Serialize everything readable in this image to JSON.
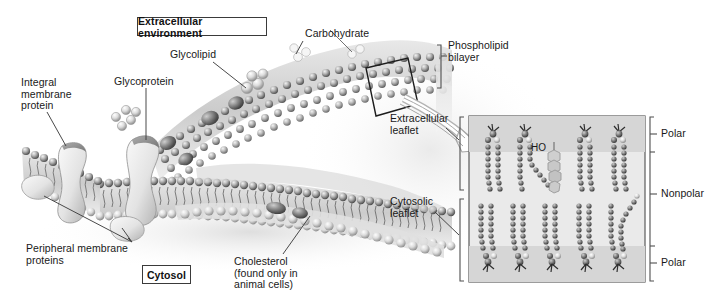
{
  "figure": {
    "title_boxes": {
      "extracellular": "Extracellular environment",
      "cytosol": "Cytosol"
    },
    "labels": {
      "integral_membrane_protein": "Integral\nmembrane\nprotein",
      "glycoprotein": "Glycoprotein",
      "glycolipid": "Glycolipid",
      "carbohydrate": "Carbohydrate",
      "phospholipid_bilayer": "Phospholipid\nbilayer",
      "extracellular_leaflet": "Extracellular\nleaflet",
      "cytosolic_leaflet": "Cytosolic\nleaflet",
      "peripheral_membrane_proteins": "Peripheral membrane\nproteins",
      "cholesterol": "Cholesterol\n(found only in\nanimal cells)",
      "polar_top": "Polar",
      "nonpolar": "Nonpolar",
      "polar_bottom": "Polar",
      "hydroxyl": "HO"
    },
    "colors": {
      "ink": "#191919",
      "leader_line": "#4a4a4a",
      "box_border": "#3a3a3a",
      "inset_background": "#e9e9e9",
      "inset_polar_band": "#d2d2d2",
      "inset_border": "#5a5a5a",
      "lipid_dark": "#3c3c3c",
      "lipid_mid": "#7a7a7a",
      "lipid_light": "#d8d8d8",
      "protein_light": "#ececec",
      "protein_shadow": "#8e8e8e",
      "background": "#ffffff"
    },
    "inset": {
      "name": "phospholipid-bilayer-detail",
      "upper_leaflet_lipid_count": 4,
      "lower_leaflet_lipid_count": 5,
      "cholesterol_count": 1,
      "zones": [
        "Polar",
        "Nonpolar",
        "Polar"
      ]
    }
  }
}
